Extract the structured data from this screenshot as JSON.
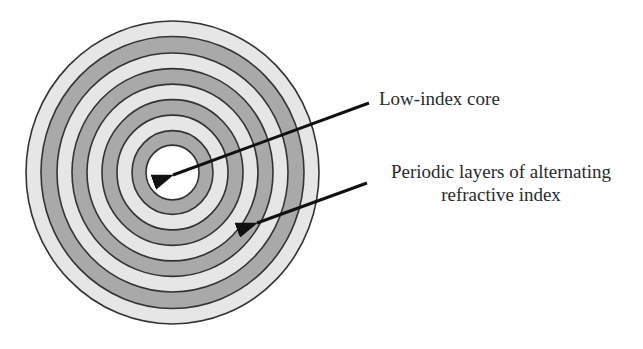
{
  "figure": {
    "type": "cross-section diagram"
  },
  "structure": {
    "center": [
      172.5,
      172.5
    ],
    "outer_radius_x": 147,
    "outer_radius_y": 152,
    "core_radius": 26,
    "ring_boundaries_r": [
      146.5,
      131.5,
      115.5,
      100.5,
      85.5,
      70.5,
      55.5,
      40.5,
      26.5
    ],
    "ring_fills": [
      "light",
      "dark",
      "light",
      "dark",
      "light",
      "dark",
      "light",
      "dark",
      "core"
    ],
    "num_dark_rings": 4,
    "num_light_rings": 4
  },
  "colors": {
    "light_band": "#e6e6e6",
    "dark_band": "#a9a9a9",
    "core": "#ffffff",
    "ring_line": "#333333",
    "arrow": "#111111",
    "text": "#2a2a2a"
  },
  "annotations": {
    "core": {
      "label": "Low-index core",
      "arrow_from": [
        369,
        103
      ],
      "arrow_to": [
        173,
        175
      ]
    },
    "layers": {
      "label_line1": "Periodic layers of alternating",
      "label_line2": "refractive index",
      "arrow_from": [
        367,
        183
      ],
      "arrow_to": [
        257,
        223
      ]
    }
  }
}
